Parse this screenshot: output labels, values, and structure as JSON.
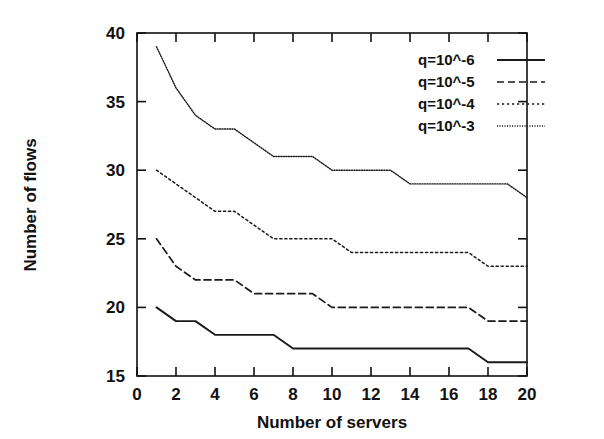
{
  "chart_data": {
    "type": "line",
    "title": "",
    "xlabel": "Number of servers",
    "ylabel": "Number of flows",
    "xlim": [
      0,
      20
    ],
    "ylim": [
      15,
      40
    ],
    "xticks": [
      0,
      2,
      4,
      6,
      8,
      10,
      12,
      14,
      16,
      18,
      20
    ],
    "yticks": [
      15,
      20,
      25,
      30,
      35,
      40
    ],
    "xtick_labels": [
      "0",
      "2",
      "4",
      "6",
      "8",
      "10",
      "12",
      "14",
      "16",
      "18",
      "20"
    ],
    "ytick_labels": [
      "15",
      "20",
      "25",
      "30",
      "35",
      "40"
    ],
    "grid": false,
    "legend_position": "top-right",
    "x": [
      1,
      2,
      3,
      4,
      5,
      6,
      7,
      8,
      9,
      10,
      11,
      12,
      13,
      14,
      15,
      16,
      17,
      18,
      19,
      20
    ],
    "series": [
      {
        "name": "q=10^-6",
        "style": "solid",
        "values": [
          20,
          19,
          19,
          18,
          18,
          18,
          18,
          17,
          17,
          17,
          17,
          17,
          17,
          17,
          17,
          17,
          17,
          16,
          16,
          16
        ]
      },
      {
        "name": "q=10^-5",
        "style": "dashed",
        "values": [
          25,
          23,
          22,
          22,
          22,
          21,
          21,
          21,
          21,
          20,
          20,
          20,
          20,
          20,
          20,
          20,
          20,
          19,
          19,
          19
        ]
      },
      {
        "name": "q=10^-4",
        "style": "dotted",
        "values": [
          30,
          29,
          28,
          27,
          27,
          26,
          25,
          25,
          25,
          25,
          24,
          24,
          24,
          24,
          24,
          24,
          24,
          23,
          23,
          23
        ]
      },
      {
        "name": "q=10^-3",
        "style": "fine-dotted",
        "values": [
          39,
          36,
          34,
          33,
          33,
          32,
          31,
          31,
          31,
          30,
          30,
          30,
          30,
          29,
          29,
          29,
          29,
          29,
          29,
          28
        ]
      }
    ]
  },
  "legend": {
    "entries": [
      {
        "label": "q=10^-6",
        "style": "solid"
      },
      {
        "label": "q=10^-5",
        "style": "dashed"
      },
      {
        "label": "q=10^-4",
        "style": "dotted"
      },
      {
        "label": "q=10^-3",
        "style": "fine-dotted"
      }
    ]
  },
  "colors": {
    "line": "#1a1a1a",
    "axis": "#111111",
    "background": "#ffffff"
  }
}
